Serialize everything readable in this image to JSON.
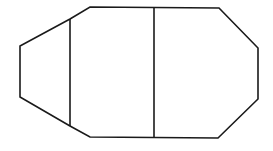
{
  "canvas": {
    "width": 273,
    "height": 151,
    "background": "#ffffff"
  },
  "style": {
    "stroke": "#1a1a1a",
    "stroke_width": 1.6
  },
  "outline": {
    "points": [
      [
        90,
        7
      ],
      [
        219,
        8
      ],
      [
        258,
        48
      ],
      [
        258,
        99
      ],
      [
        218,
        138
      ],
      [
        90,
        137
      ],
      [
        70,
        126
      ],
      [
        20,
        97
      ],
      [
        20,
        46
      ],
      [
        70,
        19
      ]
    ]
  },
  "dividers": [
    {
      "name": "left-divider",
      "x1": 70,
      "y1": 19,
      "x2": 70,
      "y2": 126
    },
    {
      "name": "middle-divider",
      "x1": 154,
      "y1": 8,
      "x2": 154,
      "y2": 138
    }
  ]
}
